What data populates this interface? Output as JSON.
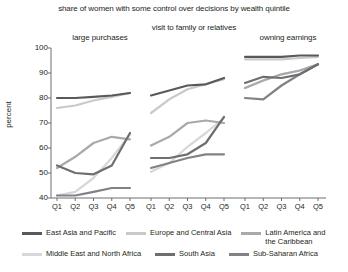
{
  "chart_data": {
    "type": "line",
    "title": "share of women with some control over decisions by wealth quintile",
    "xlabel": "",
    "ylabel": "percent",
    "ylim": [
      40,
      100
    ],
    "yticks": [
      40,
      50,
      60,
      70,
      80,
      90,
      100
    ],
    "ytick_labels": [
      "40",
      "50",
      "60",
      "70",
      "80",
      "90",
      "100"
    ],
    "categories": [
      "Q1",
      "Q2",
      "Q3",
      "Q4",
      "Q5"
    ],
    "grid": false,
    "legend_position": "bottom",
    "panels": [
      {
        "title": "large purchases",
        "series": [
          {
            "name": "East Asia and Pacific",
            "color": "#58595b",
            "values": [
              80.0,
              80.0,
              80.5,
              81.0,
              82.0
            ]
          },
          {
            "name": "Europe and Central Asia",
            "color": "#c8c9ca",
            "values": [
              76.0,
              77.0,
              79.0,
              80.5,
              82.0
            ]
          },
          {
            "name": "Latin America and the Caribbean",
            "color": "#a7a9ac",
            "values": [
              52.0,
              56.5,
              62.0,
              64.5,
              63.5
            ]
          },
          {
            "name": "Middle East and North Africa",
            "color": "#d6d7d8",
            "values": [
              41.0,
              42.5,
              48.0,
              56.0,
              65.5
            ]
          },
          {
            "name": "South Asia",
            "color": "#6d6e71",
            "values": [
              53.0,
              50.0,
              49.5,
              53.0,
              66.0
            ]
          },
          {
            "name": "Sub-Saharan Africa",
            "color": "#808285",
            "values": [
              41.0,
              41.0,
              42.5,
              44.0,
              44.0
            ]
          }
        ]
      },
      {
        "title": "visit to\nfamily or relatives",
        "series": [
          {
            "name": "East Asia and Pacific",
            "color": "#58595b",
            "values": [
              81.0,
              83.0,
              85.0,
              85.5,
              88.0
            ]
          },
          {
            "name": "Europe and Central Asia",
            "color": "#c8c9ca",
            "values": [
              74.0,
              79.5,
              83.5,
              85.5,
              87.5
            ]
          },
          {
            "name": "Latin America and the Caribbean",
            "color": "#a7a9ac",
            "values": [
              61.0,
              64.5,
              70.0,
              71.0,
              70.0
            ]
          },
          {
            "name": "Middle East and North Africa",
            "color": "#d6d7d8",
            "values": [
              50.5,
              54.0,
              60.5,
              66.0,
              72.0
            ]
          },
          {
            "name": "South Asia",
            "color": "#6d6e71",
            "values": [
              56.0,
              56.0,
              57.5,
              62.0,
              72.5
            ]
          },
          {
            "name": "Sub-Saharan Africa",
            "color": "#808285",
            "values": [
              52.0,
              54.0,
              56.0,
              57.5,
              57.5
            ]
          }
        ]
      },
      {
        "title": "owning earnings",
        "series": [
          {
            "name": "East Asia and Pacific",
            "color": "#58595b",
            "values": [
              96.5,
              96.5,
              96.5,
              97.0,
              97.0
            ]
          },
          {
            "name": "Europe and Central Asia",
            "color": "#c8c9ca",
            "values": [
              95.5,
              95.5,
              95.5,
              96.0,
              96.5
            ]
          },
          {
            "name": "Latin America and the Caribbean",
            "color": "#a7a9ac",
            "values": [
              84.0,
              87.0,
              89.5,
              91.0,
              93.5
            ]
          },
          {
            "name": "Middle East and North Africa",
            "color": "#d6d7d8",
            "values": [
              84.0,
              87.0,
              89.5,
              91.0,
              93.5
            ]
          },
          {
            "name": "South Asia",
            "color": "#6d6e71",
            "values": [
              86.0,
              88.5,
              88.0,
              89.5,
              93.5
            ]
          },
          {
            "name": "Sub-Saharan Africa",
            "color": "#808285",
            "values": [
              80.0,
              79.5,
              85.0,
              89.5,
              93.5
            ]
          }
        ]
      }
    ]
  },
  "legend": {
    "row1": [
      {
        "label": "East Asia and Pacific",
        "color": "#58595b"
      },
      {
        "label": "Europe and Central Asia",
        "color": "#c8c9ca"
      },
      {
        "label": "Latin America and\nthe Caribbean",
        "color": "#a7a9ac"
      }
    ],
    "row2": [
      {
        "label": "Middle East and North Africa",
        "color": "#d6d7d8"
      },
      {
        "label": "South Asia",
        "color": "#6d6e71"
      },
      {
        "label": "Sub-Saharan Africa",
        "color": "#808285"
      }
    ]
  },
  "axis": {
    "y_title": "percent",
    "axis_color": "#6d6e71"
  }
}
